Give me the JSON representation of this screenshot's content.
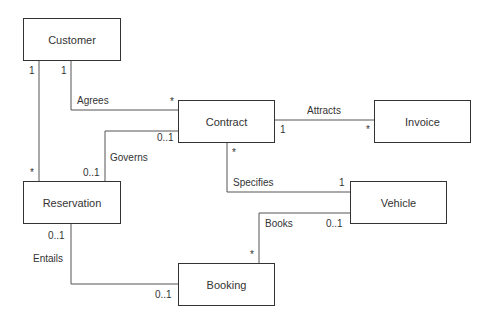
{
  "diagram": {
    "type": "UML class diagram",
    "classes": [
      {
        "id": "customer",
        "name": "Customer"
      },
      {
        "id": "contract",
        "name": "Contract"
      },
      {
        "id": "invoice",
        "name": "Invoice"
      },
      {
        "id": "reservation",
        "name": "Reservation"
      },
      {
        "id": "vehicle",
        "name": "Vehicle"
      },
      {
        "id": "booking",
        "name": "Booking"
      }
    ],
    "associations": [
      {
        "name": "Agrees",
        "from": "Customer",
        "to": "Contract",
        "from_mult": "1",
        "to_mult": "*"
      },
      {
        "name": "",
        "from": "Customer",
        "to": "Reservation",
        "from_mult": "1",
        "to_mult": "*"
      },
      {
        "name": "Attracts",
        "from": "Contract",
        "to": "Invoice",
        "from_mult": "1",
        "to_mult": "*"
      },
      {
        "name": "Governs",
        "from": "Reservation",
        "to": "Contract",
        "from_mult": "0..1",
        "to_mult": "0..1"
      },
      {
        "name": "Specifies",
        "from": "Contract",
        "to": "Vehicle",
        "from_mult": "*",
        "to_mult": "1"
      },
      {
        "name": "Books",
        "from": "Booking",
        "to": "Vehicle",
        "from_mult": "*",
        "to_mult": "0..1"
      },
      {
        "name": "Entails",
        "from": "Reservation",
        "to": "Booking",
        "from_mult": "0..1",
        "to_mult": "0..1"
      }
    ]
  },
  "labels": {
    "agrees": "Agrees",
    "attracts": "Attracts",
    "governs": "Governs",
    "specifies": "Specifies",
    "books": "Books",
    "entails": "Entails",
    "m_one": "1",
    "m_many": "*",
    "m_opt": "0..1"
  }
}
